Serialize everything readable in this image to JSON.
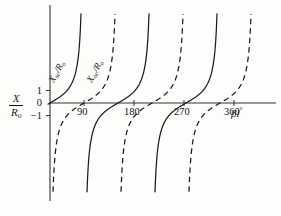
{
  "figure": {
    "background_color": "#fdfdfb",
    "line_color": "#1c1c1c"
  },
  "axes": {
    "y_axis_title_numerator": "X",
    "y_axis_title_denominator": "R",
    "y_axis_title_denominator_sub": "o",
    "x_axis_title_main": "βl",
    "x_axis_title_degree": "°",
    "y_ticks": [
      {
        "label": "1",
        "value": 1
      },
      {
        "label": "0",
        "value": 0
      },
      {
        "label": "−1",
        "value": -1
      }
    ],
    "x_ticks": [
      {
        "label": "90",
        "value": 90
      },
      {
        "label": "180",
        "value": 180
      },
      {
        "label": "270",
        "value": 270
      },
      {
        "label": "360",
        "value": 360
      }
    ]
  },
  "curve_labels": {
    "short_circuit": {
      "symbol": "X",
      "subscript": "sc",
      "divider": "/",
      "denominator": "R",
      "denominator_sub": "o"
    },
    "open_circuit": {
      "symbol": "X",
      "subscript": "oc",
      "divider": "/",
      "denominator": "R",
      "denominator_sub": "o"
    }
  },
  "chart_data": {
    "type": "line",
    "title": "",
    "xlabel": "βl°",
    "ylabel": "X/R₀",
    "xlim": [
      0,
      420
    ],
    "ylim": [
      -7.5,
      7.5
    ],
    "grid": false,
    "legend_position": "inline-curve-labels",
    "x_tick_values": [
      90,
      180,
      270,
      360
    ],
    "x_tick_labels": [
      "90",
      "180",
      "270",
      "360"
    ],
    "y_tick_values": [
      1,
      0,
      -1
    ],
    "y_tick_labels": [
      "1",
      "0",
      "−1"
    ],
    "series": [
      {
        "name": "Xsc/Ro",
        "style": "solid",
        "formula": "tan(beta*l)",
        "asymptotes_deg": [
          90,
          270
        ],
        "zeros_deg": [
          0,
          180,
          360
        ],
        "sample_points": [
          {
            "x": 0,
            "y": 0
          },
          {
            "x": 15,
            "y": 0.27
          },
          {
            "x": 30,
            "y": 0.58
          },
          {
            "x": 45,
            "y": 1.0
          },
          {
            "x": 60,
            "y": 1.73
          },
          {
            "x": 75,
            "y": 3.73
          },
          {
            "x": 82,
            "y": 7.12
          },
          {
            "x": 98,
            "y": -7.12
          },
          {
            "x": 105,
            "y": -3.73
          },
          {
            "x": 120,
            "y": -1.73
          },
          {
            "x": 135,
            "y": -1.0
          },
          {
            "x": 150,
            "y": -0.58
          },
          {
            "x": 165,
            "y": -0.27
          },
          {
            "x": 180,
            "y": 0
          },
          {
            "x": 195,
            "y": 0.27
          },
          {
            "x": 225,
            "y": 1.0
          },
          {
            "x": 255,
            "y": 3.73
          },
          {
            "x": 262,
            "y": 7.12
          },
          {
            "x": 278,
            "y": -7.12
          },
          {
            "x": 285,
            "y": -3.73
          },
          {
            "x": 315,
            "y": -1.0
          },
          {
            "x": 345,
            "y": -0.27
          },
          {
            "x": 360,
            "y": 0
          },
          {
            "x": 375,
            "y": 0.27
          },
          {
            "x": 405,
            "y": 1.0
          }
        ]
      },
      {
        "name": "Xoc/Ro",
        "style": "dashed",
        "formula": "-cot(beta*l)",
        "asymptotes_deg": [
          0,
          180,
          360
        ],
        "zeros_deg": [
          90,
          270
        ],
        "sample_points": [
          {
            "x": 8,
            "y": -7.12
          },
          {
            "x": 15,
            "y": -3.73
          },
          {
            "x": 30,
            "y": -1.73
          },
          {
            "x": 45,
            "y": -1.0
          },
          {
            "x": 60,
            "y": -0.58
          },
          {
            "x": 75,
            "y": -0.27
          },
          {
            "x": 90,
            "y": 0
          },
          {
            "x": 105,
            "y": 0.27
          },
          {
            "x": 120,
            "y": 0.58
          },
          {
            "x": 135,
            "y": 1.0
          },
          {
            "x": 150,
            "y": 1.73
          },
          {
            "x": 165,
            "y": 3.73
          },
          {
            "x": 172,
            "y": 7.12
          },
          {
            "x": 188,
            "y": -7.12
          },
          {
            "x": 195,
            "y": -3.73
          },
          {
            "x": 225,
            "y": -1.0
          },
          {
            "x": 255,
            "y": -0.27
          },
          {
            "x": 270,
            "y": 0
          },
          {
            "x": 285,
            "y": 0.27
          },
          {
            "x": 315,
            "y": 1.0
          },
          {
            "x": 345,
            "y": 3.73
          },
          {
            "x": 352,
            "y": 7.12
          },
          {
            "x": 368,
            "y": -7.12
          },
          {
            "x": 375,
            "y": -3.73
          },
          {
            "x": 405,
            "y": -1.0
          }
        ]
      }
    ]
  }
}
